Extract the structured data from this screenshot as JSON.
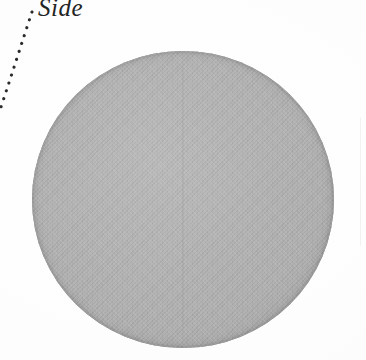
{
  "figure": {
    "title": "Side",
    "background_color": "#fefefe",
    "width": 366,
    "height": 360
  },
  "callout": {
    "label": "Side",
    "text_color": "#242424",
    "leader_style": "dotted",
    "leader_color": "#2b2b2b",
    "leader_path": "M 32,12 C 22,42 12,74 0,110"
  },
  "disc": {
    "name": "Side",
    "shape": "circle",
    "center_x": 183,
    "center_y": 200,
    "radius": 150,
    "fill_color": "#b1b1b1",
    "rim_color": "#9d9d9d",
    "seam": "vertical-center-line",
    "texture": "woven-halftone"
  }
}
